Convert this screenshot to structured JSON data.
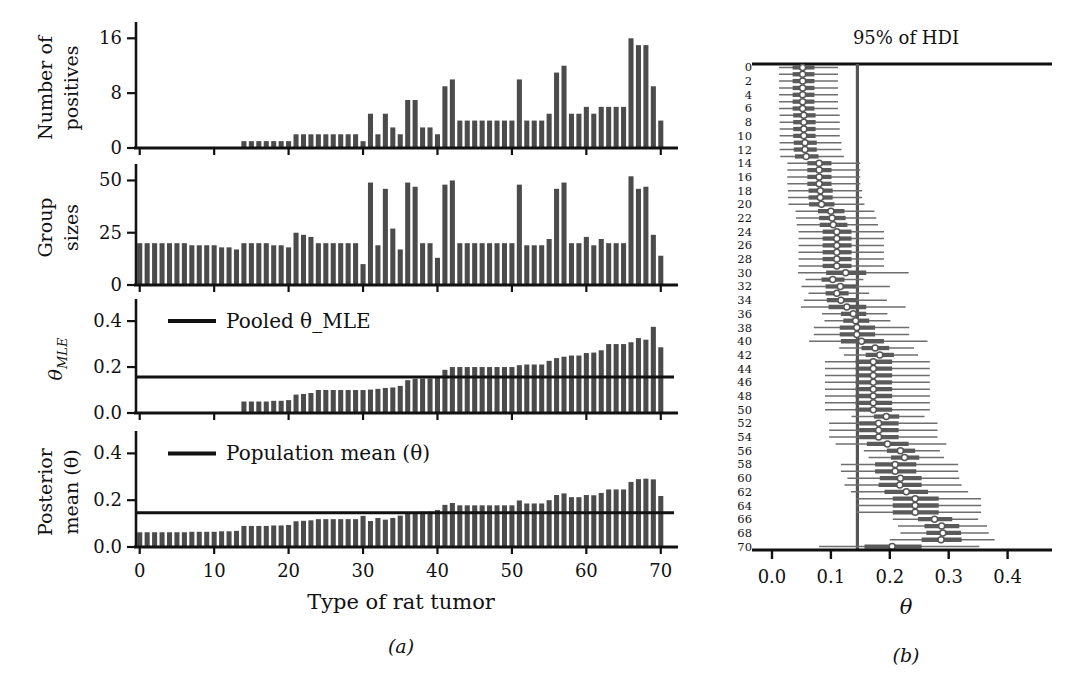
{
  "figure": {
    "panel_a_caption": "(a)",
    "panel_b_caption": "(b)",
    "xlabel_a": "Type of rat tumor",
    "xlabel_b": "θ",
    "title_b": "95% of HDI"
  },
  "panels": {
    "positives": {
      "ylabel_line1": "Number of",
      "ylabel_line2": "positives",
      "yticks": [
        "0",
        "8",
        "16"
      ]
    },
    "group_sizes": {
      "ylabel_line1": "Group",
      "ylabel_line2": "sizes",
      "yticks": [
        "0",
        "25",
        "50"
      ]
    },
    "theta_mle": {
      "ylabel": "θ_MLE",
      "yticks": [
        "0.0",
        "0.2",
        "0.4"
      ],
      "legend": "Pooled θ_MLE"
    },
    "posterior_mean": {
      "ylabel_line1": "Posterior",
      "ylabel_line2": "mean (θ)",
      "yticks": [
        "0.0",
        "0.2",
        "0.4"
      ],
      "legend": "Population mean (θ)"
    }
  },
  "axis": {
    "xticks_a": [
      "0",
      "10",
      "20",
      "30",
      "40",
      "50",
      "60",
      "70"
    ],
    "xticks_a_values": [
      0,
      10,
      20,
      30,
      40,
      50,
      60,
      70
    ],
    "xticks_b": [
      "0.0",
      "0.1",
      "0.2",
      "0.3",
      "0.4"
    ],
    "xticks_b_values": [
      0.0,
      0.1,
      0.2,
      0.3,
      0.4
    ],
    "yticks_b": [
      "0",
      "2",
      "4",
      "6",
      "8",
      "10",
      "12",
      "14",
      "16",
      "18",
      "20",
      "22",
      "24",
      "26",
      "28",
      "30",
      "32",
      "34",
      "36",
      "38",
      "40",
      "42",
      "44",
      "46",
      "48",
      "50",
      "52",
      "54",
      "56",
      "58",
      "60",
      "62",
      "64",
      "66",
      "68",
      "70"
    ]
  },
  "colors": {
    "bar": "#4b4b4b",
    "axis": "#111111",
    "hdi_line": "#6e6e6e",
    "hdi_band": "#5a5a5a",
    "marker_fill": "#ffffff",
    "background": "#ffffff"
  },
  "chart_data": {
    "type": "bar",
    "xlabel": "Type of rat tumor",
    "n_groups": 71,
    "x": [
      0,
      1,
      2,
      3,
      4,
      5,
      6,
      7,
      8,
      9,
      10,
      11,
      12,
      13,
      14,
      15,
      16,
      17,
      18,
      19,
      20,
      21,
      22,
      23,
      24,
      25,
      26,
      27,
      28,
      29,
      30,
      31,
      32,
      33,
      34,
      35,
      36,
      37,
      38,
      39,
      40,
      41,
      42,
      43,
      44,
      45,
      46,
      47,
      48,
      49,
      50,
      51,
      52,
      53,
      54,
      55,
      56,
      57,
      58,
      59,
      60,
      61,
      62,
      63,
      64,
      65,
      66,
      67,
      68,
      69,
      70
    ],
    "series": [
      {
        "name": "Number of positives",
        "ylabel": "Number of positives",
        "ylim": [
          0,
          17.5
        ],
        "yticks": [
          0,
          8,
          16
        ],
        "values": [
          0,
          0,
          0,
          0,
          0,
          0,
          0,
          0,
          0,
          0,
          0,
          0,
          0,
          0,
          1,
          1,
          1,
          1,
          1,
          1,
          1,
          2,
          2,
          2,
          2,
          2,
          2,
          2,
          2,
          2,
          1,
          5,
          2,
          5,
          3,
          2,
          7,
          7,
          3,
          3,
          2,
          9,
          10,
          4,
          4,
          4,
          4,
          4,
          4,
          4,
          4,
          10,
          4,
          4,
          4,
          5,
          11,
          12,
          5,
          5,
          6,
          5,
          6,
          6,
          6,
          6,
          16,
          15,
          15,
          9,
          4
        ]
      },
      {
        "name": "Group sizes",
        "ylabel": "Group sizes",
        "ylim": [
          0,
          55
        ],
        "yticks": [
          0,
          25,
          50
        ],
        "values": [
          20,
          20,
          20,
          20,
          20,
          20,
          20,
          19,
          19,
          19,
          19,
          18,
          18,
          17,
          20,
          20,
          20,
          20,
          19,
          19,
          18,
          25,
          24,
          23,
          20,
          20,
          20,
          20,
          20,
          20,
          10,
          49,
          19,
          46,
          27,
          17,
          49,
          47,
          20,
          20,
          13,
          48,
          50,
          20,
          20,
          20,
          20,
          20,
          20,
          20,
          20,
          48,
          19,
          19,
          19,
          22,
          46,
          49,
          20,
          20,
          23,
          19,
          22,
          20,
          20,
          20,
          52,
          46,
          47,
          24,
          14
        ]
      },
      {
        "name": "Theta MLE",
        "ylabel": "θ_MLE",
        "ylim": [
          0.0,
          0.47
        ],
        "yticks": [
          0.0,
          0.2,
          0.4
        ],
        "reference_line": 0.157,
        "reference_label": "Pooled θ_MLE",
        "values": [
          0.0,
          0.0,
          0.0,
          0.0,
          0.0,
          0.0,
          0.0,
          0.0,
          0.0,
          0.0,
          0.0,
          0.0,
          0.0,
          0.0,
          0.05,
          0.05,
          0.05,
          0.05,
          0.053,
          0.053,
          0.056,
          0.08,
          0.083,
          0.087,
          0.1,
          0.1,
          0.1,
          0.1,
          0.1,
          0.1,
          0.1,
          0.102,
          0.105,
          0.109,
          0.111,
          0.118,
          0.143,
          0.149,
          0.15,
          0.15,
          0.154,
          0.188,
          0.2,
          0.2,
          0.2,
          0.2,
          0.2,
          0.2,
          0.2,
          0.2,
          0.2,
          0.208,
          0.211,
          0.211,
          0.211,
          0.227,
          0.239,
          0.245,
          0.25,
          0.25,
          0.261,
          0.263,
          0.273,
          0.3,
          0.3,
          0.3,
          0.308,
          0.326,
          0.319,
          0.375,
          0.286
        ]
      },
      {
        "name": "Posterior mean (theta)",
        "ylabel": "Posterior mean (θ)",
        "ylim": [
          0.0,
          0.47
        ],
        "yticks": [
          0.0,
          0.2,
          0.4
        ],
        "reference_line": 0.146,
        "reference_label": "Population mean (θ)",
        "values": [
          0.063,
          0.063,
          0.063,
          0.063,
          0.063,
          0.063,
          0.063,
          0.065,
          0.065,
          0.065,
          0.065,
          0.067,
          0.067,
          0.069,
          0.09,
          0.09,
          0.09,
          0.09,
          0.092,
          0.092,
          0.094,
          0.11,
          0.112,
          0.114,
          0.119,
          0.119,
          0.119,
          0.119,
          0.119,
          0.119,
          0.133,
          0.111,
          0.124,
          0.117,
          0.124,
          0.134,
          0.145,
          0.149,
          0.151,
          0.151,
          0.158,
          0.18,
          0.188,
          0.178,
          0.178,
          0.178,
          0.178,
          0.178,
          0.178,
          0.178,
          0.178,
          0.199,
          0.186,
          0.186,
          0.186,
          0.2,
          0.222,
          0.229,
          0.213,
          0.213,
          0.222,
          0.221,
          0.231,
          0.246,
          0.246,
          0.246,
          0.278,
          0.29,
          0.292,
          0.289,
          0.218
        ]
      }
    ],
    "hdi_plot": {
      "type": "interval",
      "title": "95% of HDI",
      "xlabel": "θ",
      "xlim": [
        0.0,
        0.455
      ],
      "xticks": [
        0.0,
        0.1,
        0.2,
        0.3,
        0.4
      ],
      "vertical_reference": 0.145,
      "rows": 71,
      "median": [
        0.052,
        0.052,
        0.052,
        0.052,
        0.052,
        0.052,
        0.052,
        0.054,
        0.054,
        0.054,
        0.054,
        0.056,
        0.056,
        0.058,
        0.08,
        0.08,
        0.08,
        0.08,
        0.082,
        0.082,
        0.084,
        0.1,
        0.102,
        0.104,
        0.11,
        0.11,
        0.11,
        0.11,
        0.11,
        0.11,
        0.125,
        0.103,
        0.116,
        0.11,
        0.117,
        0.127,
        0.138,
        0.142,
        0.144,
        0.144,
        0.152,
        0.175,
        0.183,
        0.172,
        0.172,
        0.172,
        0.172,
        0.172,
        0.172,
        0.172,
        0.172,
        0.194,
        0.181,
        0.181,
        0.181,
        0.196,
        0.218,
        0.225,
        0.209,
        0.209,
        0.218,
        0.217,
        0.228,
        0.243,
        0.243,
        0.243,
        0.276,
        0.288,
        0.29,
        0.287,
        0.204
      ],
      "hdi_low": [
        0.012,
        0.012,
        0.012,
        0.012,
        0.012,
        0.012,
        0.012,
        0.013,
        0.013,
        0.013,
        0.013,
        0.013,
        0.013,
        0.014,
        0.026,
        0.026,
        0.026,
        0.026,
        0.027,
        0.027,
        0.028,
        0.04,
        0.041,
        0.042,
        0.045,
        0.045,
        0.045,
        0.045,
        0.045,
        0.045,
        0.044,
        0.057,
        0.05,
        0.062,
        0.054,
        0.049,
        0.085,
        0.089,
        0.071,
        0.071,
        0.063,
        0.114,
        0.122,
        0.09,
        0.09,
        0.09,
        0.09,
        0.09,
        0.09,
        0.09,
        0.09,
        0.135,
        0.097,
        0.097,
        0.097,
        0.108,
        0.156,
        0.164,
        0.117,
        0.117,
        0.128,
        0.123,
        0.134,
        0.143,
        0.143,
        0.143,
        0.205,
        0.214,
        0.218,
        0.2,
        0.08
      ],
      "hdi_high": [
        0.112,
        0.112,
        0.112,
        0.112,
        0.112,
        0.112,
        0.112,
        0.115,
        0.115,
        0.115,
        0.115,
        0.118,
        0.118,
        0.122,
        0.15,
        0.15,
        0.15,
        0.15,
        0.153,
        0.153,
        0.157,
        0.174,
        0.177,
        0.18,
        0.19,
        0.19,
        0.19,
        0.19,
        0.19,
        0.19,
        0.232,
        0.155,
        0.2,
        0.165,
        0.195,
        0.227,
        0.196,
        0.201,
        0.233,
        0.233,
        0.264,
        0.241,
        0.248,
        0.268,
        0.268,
        0.268,
        0.268,
        0.268,
        0.268,
        0.268,
        0.268,
        0.259,
        0.281,
        0.281,
        0.281,
        0.296,
        0.285,
        0.292,
        0.316,
        0.316,
        0.318,
        0.322,
        0.333,
        0.355,
        0.355,
        0.355,
        0.35,
        0.365,
        0.368,
        0.378,
        0.352
      ],
      "iqr_low": [
        0.035,
        0.035,
        0.035,
        0.035,
        0.035,
        0.035,
        0.035,
        0.036,
        0.036,
        0.036,
        0.036,
        0.037,
        0.037,
        0.039,
        0.06,
        0.06,
        0.06,
        0.06,
        0.062,
        0.062,
        0.063,
        0.078,
        0.08,
        0.081,
        0.086,
        0.086,
        0.086,
        0.086,
        0.086,
        0.086,
        0.092,
        0.084,
        0.091,
        0.091,
        0.093,
        0.096,
        0.117,
        0.121,
        0.115,
        0.115,
        0.117,
        0.152,
        0.159,
        0.142,
        0.142,
        0.142,
        0.142,
        0.142,
        0.142,
        0.142,
        0.142,
        0.173,
        0.148,
        0.148,
        0.148,
        0.161,
        0.195,
        0.202,
        0.175,
        0.175,
        0.183,
        0.181,
        0.191,
        0.205,
        0.205,
        0.205,
        0.248,
        0.259,
        0.262,
        0.254,
        0.157
      ],
      "iqr_high": [
        0.072,
        0.072,
        0.072,
        0.072,
        0.072,
        0.072,
        0.072,
        0.074,
        0.074,
        0.074,
        0.074,
        0.076,
        0.076,
        0.079,
        0.101,
        0.101,
        0.101,
        0.101,
        0.103,
        0.103,
        0.106,
        0.123,
        0.125,
        0.128,
        0.135,
        0.135,
        0.135,
        0.135,
        0.135,
        0.135,
        0.16,
        0.123,
        0.143,
        0.13,
        0.143,
        0.16,
        0.16,
        0.165,
        0.175,
        0.175,
        0.19,
        0.199,
        0.207,
        0.204,
        0.204,
        0.204,
        0.204,
        0.204,
        0.204,
        0.204,
        0.204,
        0.216,
        0.215,
        0.215,
        0.215,
        0.232,
        0.243,
        0.25,
        0.245,
        0.245,
        0.254,
        0.254,
        0.265,
        0.283,
        0.283,
        0.283,
        0.306,
        0.318,
        0.321,
        0.322,
        0.254
      ]
    }
  }
}
